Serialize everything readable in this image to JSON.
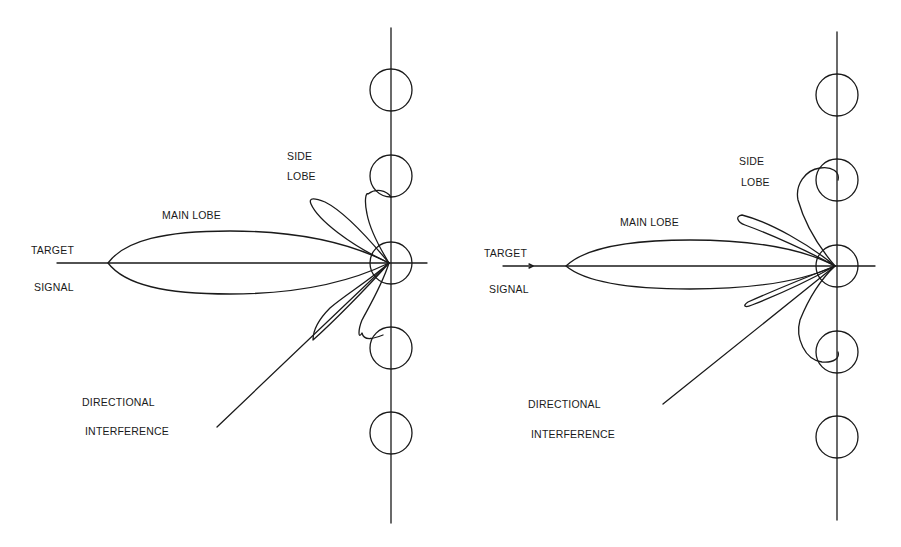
{
  "figure": {
    "ink_color": "#1a1a1a",
    "background": "#ffffff",
    "panels": [
      {
        "id": "left",
        "description": "Array beam pattern with side lobe and directional interference falling on a side lobe",
        "labels": {
          "target_line1": "TARGET",
          "target_line2": "SIGNAL",
          "main_lobe": "MAIN LOBE",
          "side_line1": "SIDE",
          "side_line2": "LOBE",
          "interference_line1": "DIRECTIONAL",
          "interference_line2": "INTERFERENCE"
        },
        "array_elements": 5
      },
      {
        "id": "right",
        "description": "Adapted beam pattern with null steered toward directional interference",
        "labels": {
          "target_line1": "TARGET",
          "target_line2": "SIGNAL",
          "main_lobe": "MAIN LOBE",
          "side_line1": "SIDE",
          "side_line2": "LOBE",
          "interference_line1": "DIRECTIONAL",
          "interference_line2": "INTERFERENCE"
        },
        "array_elements": 5
      }
    ]
  }
}
